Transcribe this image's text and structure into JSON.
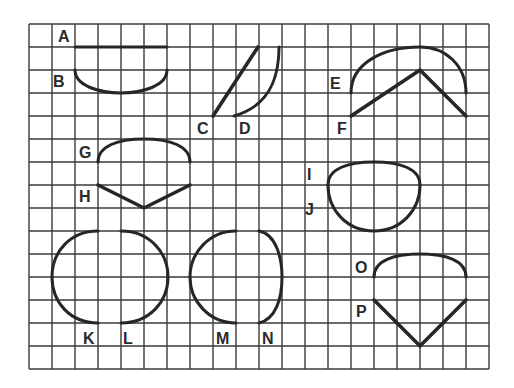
{
  "figure": {
    "grid": {
      "left": 29,
      "top": 24,
      "cell": 23,
      "cols": 20,
      "rows": 15,
      "line_color": "#3a3a3a"
    },
    "stroke_color": "#262626",
    "items": [
      {
        "label": "A",
        "kind": "line",
        "label_pos": [
          66,
          42
        ],
        "path": "M75 47 L167 47"
      },
      {
        "label": "B",
        "kind": "arc",
        "label_pos": [
          60,
          87
        ],
        "path": "M75 70 C75 86 100 93 121 93 C142 93 167 86 167 70"
      },
      {
        "label": "C",
        "kind": "line",
        "label_pos": [
          203,
          134
        ],
        "path": "M213 116 L258 47"
      },
      {
        "label": "D",
        "kind": "curve",
        "label_pos": [
          245,
          134
        ],
        "path": "M234 116 C262 108 279 88 279 47"
      },
      {
        "label": "E",
        "kind": "arc",
        "label_pos": [
          337,
          89
        ],
        "path": "M351 93 C351 62 385 47 420 47 C445 47 466 65 466 93"
      },
      {
        "label": "F",
        "kind": "polyline",
        "label_pos": [
          343,
          133
        ],
        "path": "M351 116 L420 70 L466 116"
      },
      {
        "label": "G",
        "kind": "arc",
        "label_pos": [
          86,
          158
        ],
        "path": "M98 162 C98 146 118 139 144 139 C170 139 190 146 190 162"
      },
      {
        "label": "H",
        "kind": "polyline",
        "label_pos": [
          86,
          202
        ],
        "path": "M98 185 L144 208 L190 185"
      },
      {
        "label": "I",
        "kind": "arc",
        "label_pos": [
          310,
          180
        ],
        "path": "M328 185 C328 169 347 162 374 162 C401 162 420 169 420 185"
      },
      {
        "label": "J",
        "kind": "arc",
        "label_pos": [
          311,
          215
        ],
        "path": "M328 185 C328 210 347 231 374 231 C401 231 420 210 420 185"
      },
      {
        "label": "K",
        "kind": "arc",
        "label_pos": [
          89,
          344
        ],
        "path": "M98 231 C70 231 52 252 52 277 C52 302 70 323 98 323"
      },
      {
        "label": "L",
        "kind": "arc",
        "label_pos": [
          128,
          344
        ],
        "path": "M121 231 C149 231 168 252 168 277 C168 302 149 323 121 323"
      },
      {
        "label": "M",
        "kind": "arc",
        "label_pos": [
          224,
          344
        ],
        "path": "M236 231 C210 231 190 252 190 277 C190 302 210 323 236 323"
      },
      {
        "label": "N",
        "kind": "curve",
        "label_pos": [
          269,
          344
        ],
        "path": "M259 231 C276 234 282 258 282 277 C282 298 276 319 259 323"
      },
      {
        "label": "O",
        "kind": "arc",
        "label_pos": [
          363,
          273
        ],
        "path": "M374 277 C374 260 395 254 420 254 C445 254 466 260 466 277"
      },
      {
        "label": "P",
        "kind": "polyline",
        "label_pos": [
          363,
          317
        ],
        "path": "M374 300 L420 346 L466 300"
      }
    ]
  },
  "labels": {
    "A": "A",
    "B": "B",
    "C": "C",
    "D": "D",
    "E": "E",
    "F": "F",
    "G": "G",
    "H": "H",
    "I": "I",
    "J": "J",
    "K": "K",
    "L": "L",
    "M": "M",
    "N": "N",
    "O": "O",
    "P": "P"
  }
}
